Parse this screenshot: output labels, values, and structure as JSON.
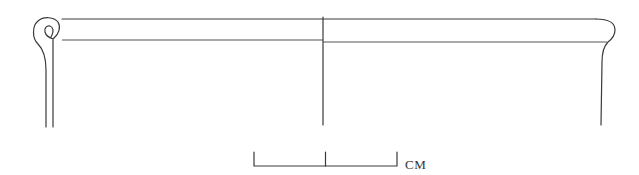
{
  "figure": {
    "type": "archaeological-vessel-profile"
  },
  "scale_bar": {
    "label": "CM",
    "divisions": 2
  },
  "colors": {
    "line": "#3a3a3a",
    "background": "#ffffff"
  }
}
